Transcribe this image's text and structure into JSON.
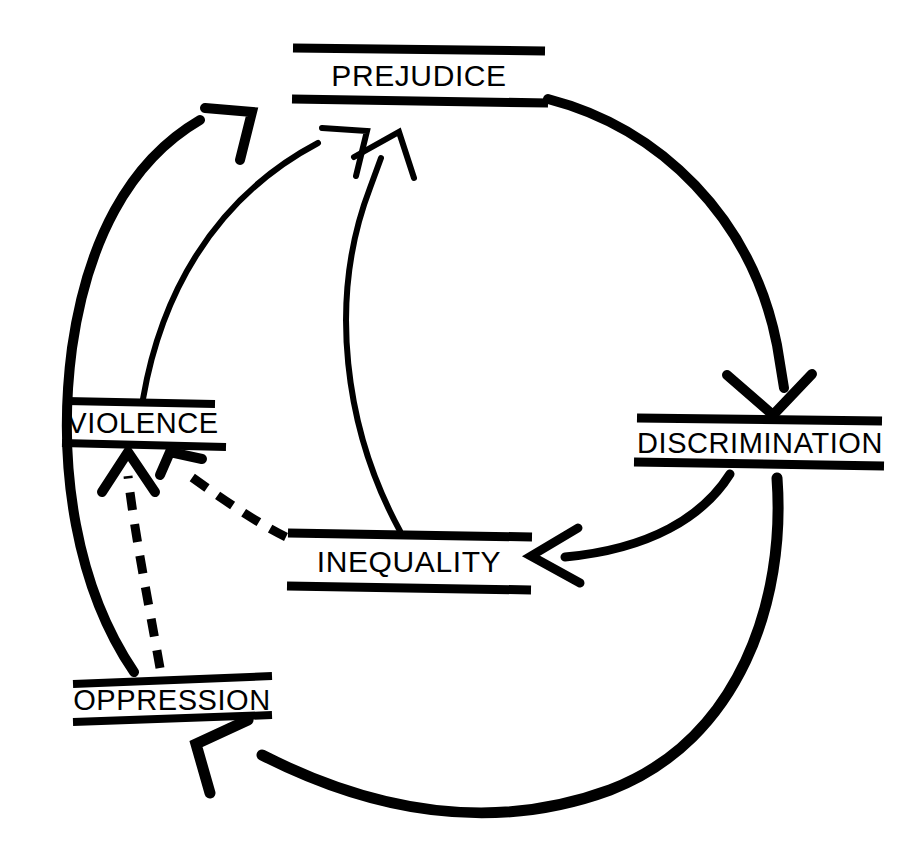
{
  "diagram": {
    "type": "cycle-diagram",
    "background_color": "#ffffff",
    "ink_color": "#000000",
    "nodes": [
      {
        "id": "prejudice",
        "label": "PREJUDICE",
        "position": "top",
        "center_x": 419,
        "center_y": 76,
        "font_size": 30
      },
      {
        "id": "discrimination",
        "label": "DISCRIMINATION",
        "position": "right",
        "center_x": 759,
        "center_y": 442,
        "font_size": 30
      },
      {
        "id": "inequality",
        "label": "INEQUALITY",
        "position": "bottom-center",
        "center_x": 408,
        "center_y": 562,
        "font_size": 30
      },
      {
        "id": "violence",
        "label": "VIOLENCE",
        "position": "left",
        "center_x": 144,
        "center_y": 423,
        "font_size": 30
      },
      {
        "id": "oppression",
        "label": "OPPRESSION",
        "position": "bottom-left",
        "center_x": 172,
        "center_y": 700,
        "font_size": 30
      }
    ],
    "edges": [
      {
        "id": "prejudice-to-discrimination",
        "from": "prejudice",
        "to": "discrimination",
        "style": "solid-thick",
        "arrow": "to-target"
      },
      {
        "id": "discrimination-to-inequality",
        "from": "discrimination",
        "to": "inequality",
        "style": "solid-thick",
        "arrow": "to-target"
      },
      {
        "id": "discrimination-to-oppression",
        "from": "discrimination",
        "to": "oppression",
        "style": "solid-thick",
        "arrow": "to-target"
      },
      {
        "id": "oppression-to-prejudice",
        "from": "oppression",
        "to": "prejudice",
        "style": "solid-thick",
        "arrow": "to-target"
      },
      {
        "id": "violence-to-prejudice",
        "from": "violence",
        "to": "prejudice",
        "style": "solid-thin",
        "arrow": "to-target"
      },
      {
        "id": "inequality-to-prejudice",
        "from": "inequality",
        "to": "prejudice",
        "style": "solid-thin",
        "arrow": "to-target"
      },
      {
        "id": "oppression-to-violence",
        "from": "oppression",
        "to": "violence",
        "style": "dashed",
        "arrow": "to-target"
      },
      {
        "id": "inequality-to-violence",
        "from": "inequality",
        "to": "violence",
        "style": "dashed",
        "arrow": "to-target"
      }
    ]
  }
}
